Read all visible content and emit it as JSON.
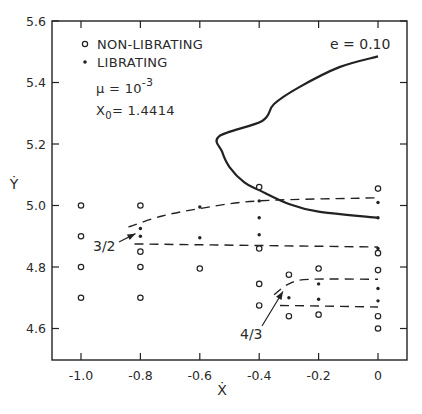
{
  "chart_data": {
    "type": "scatter",
    "title": "",
    "xlabel": "Ẋ",
    "ylabel": "Ẏ",
    "xlim": [
      -1.1,
      0.1
    ],
    "ylim": [
      4.5,
      5.6
    ],
    "grid": false,
    "xticks": [
      -1.0,
      -0.8,
      -0.6,
      -0.4,
      -0.2,
      0.0
    ],
    "xtick_labels": [
      "-1.0",
      "-0.8",
      "-0.6",
      "-0.4",
      "-0.2",
      "0"
    ],
    "yticks": [
      4.6,
      4.8,
      5.0,
      5.2,
      5.4,
      5.6
    ],
    "ytick_labels": [
      "4.6",
      "4.8",
      "5.0",
      "5.2",
      "5.4",
      "5.6"
    ],
    "legend": {
      "position": "upper-left",
      "entries": [
        {
          "marker": "open-circle",
          "label": "NON-LIBRATING"
        },
        {
          "marker": "filled-dot",
          "label": "LIBRATING"
        }
      ],
      "params": [
        {
          "name": "mu",
          "text_prefix": "μ = 10",
          "exponent": "-3"
        },
        {
          "name": "x0",
          "text_prefix": "X",
          "subscript": "0",
          "text_suffix": "= 1.4414"
        }
      ]
    },
    "series": [
      {
        "name": "NON-LIBRATING",
        "marker": "open-circle",
        "points": [
          [
            -1.0,
            5.0
          ],
          [
            -1.0,
            4.9
          ],
          [
            -1.0,
            4.8
          ],
          [
            -1.0,
            4.7
          ],
          [
            -0.8,
            5.0
          ],
          [
            -0.8,
            4.85
          ],
          [
            -0.8,
            4.8
          ],
          [
            -0.8,
            4.7
          ],
          [
            -0.6,
            4.795
          ],
          [
            -0.4,
            5.06
          ],
          [
            -0.4,
            4.86
          ],
          [
            -0.4,
            4.745
          ],
          [
            -0.4,
            4.675
          ],
          [
            -0.3,
            4.775
          ],
          [
            -0.3,
            4.64
          ],
          [
            -0.2,
            4.795
          ],
          [
            -0.2,
            4.645
          ],
          [
            0.0,
            5.055
          ],
          [
            0.0,
            4.845
          ],
          [
            0.0,
            4.79
          ],
          [
            0.0,
            4.64
          ],
          [
            0.0,
            4.6
          ]
        ]
      },
      {
        "name": "LIBRATING",
        "marker": "filled-dot",
        "points": [
          [
            -0.8,
            4.925
          ],
          [
            -0.8,
            4.9
          ],
          [
            -0.6,
            4.995
          ],
          [
            -0.6,
            4.895
          ],
          [
            -0.4,
            5.015
          ],
          [
            -0.4,
            4.96
          ],
          [
            -0.4,
            4.905
          ],
          [
            -0.3,
            4.7
          ],
          [
            -0.2,
            4.745
          ],
          [
            -0.2,
            4.695
          ],
          [
            0.0,
            5.01
          ],
          [
            0.0,
            4.96
          ],
          [
            0.0,
            4.86
          ],
          [
            0.0,
            4.73
          ],
          [
            0.0,
            4.69
          ]
        ]
      }
    ],
    "curves": [
      {
        "name": "e = 0.10",
        "style": "solid",
        "label": "e = 0.10",
        "points": [
          [
            0.0,
            5.485
          ],
          [
            -0.13,
            5.45
          ],
          [
            -0.265,
            5.385
          ],
          [
            -0.35,
            5.33
          ],
          [
            -0.39,
            5.275
          ],
          [
            -0.535,
            5.225
          ],
          [
            -0.525,
            5.175
          ],
          [
            -0.5,
            5.125
          ],
          [
            -0.45,
            5.075
          ],
          [
            -0.4,
            5.05
          ],
          [
            -0.3,
            5.005
          ],
          [
            -0.2,
            4.98
          ],
          [
            0.0,
            4.96
          ]
        ]
      },
      {
        "name": "3/2 upper boundary",
        "style": "dashed",
        "points": [
          [
            -0.84,
            4.93
          ],
          [
            -0.73,
            4.965
          ],
          [
            -0.6,
            4.99
          ],
          [
            -0.4,
            5.015
          ],
          [
            0.0,
            5.025
          ]
        ]
      },
      {
        "name": "3/2 lower boundary",
        "style": "dashed",
        "points": [
          [
            -0.82,
            4.875
          ],
          [
            0.0,
            4.865
          ]
        ]
      },
      {
        "name": "4/3 upper boundary",
        "style": "dashed",
        "points": [
          [
            -0.35,
            4.71
          ],
          [
            -0.3,
            4.745
          ],
          [
            -0.23,
            4.76
          ],
          [
            0.0,
            4.76
          ]
        ]
      },
      {
        "name": "4/3 lower boundary",
        "style": "dashed",
        "points": [
          [
            -0.33,
            4.675
          ],
          [
            0.0,
            4.67
          ]
        ]
      }
    ],
    "annotations": [
      {
        "text": "3/2",
        "arrow_to": [
          -0.81,
          4.915
        ]
      },
      {
        "text": "4/3",
        "arrow_to": [
          -0.31,
          4.73
        ]
      },
      {
        "text": "e = 0.10",
        "at": [
          -0.16,
          5.555
        ]
      }
    ]
  },
  "labels": {
    "x_axis": "Ẋ",
    "y_axis": "Ẏ",
    "legend_nonlib": "NON-LIBRATING",
    "legend_lib": "LIBRATING",
    "mu_prefix": "μ = 10",
    "mu_exp": "-3",
    "x0_prefix": "X",
    "x0_sub": "0",
    "x0_suffix": "= 1.4414",
    "curve_label": "e = 0.10",
    "res_32": "3/2",
    "res_43": "4/3"
  },
  "colors": {
    "ink": "#222222",
    "background": "#ffffff"
  }
}
